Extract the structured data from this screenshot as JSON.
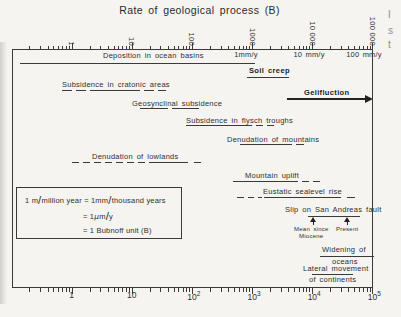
{
  "figure": {
    "title": "Rate of geological process (B)",
    "background": "#f5f4f1",
    "ink": "#3a3a3a",
    "top_axis": {
      "tick_labels": [
        {
          "text": "1",
          "value": 1
        },
        {
          "text": "10",
          "value": 10
        },
        {
          "text": "100",
          "value": 100
        },
        {
          "text": "1000",
          "value": 1000
        },
        {
          "text": "10 000",
          "value": 10000
        },
        {
          "text": "100 000",
          "value": 100000
        }
      ],
      "rate_labels": [
        {
          "text": "1mm/y",
          "x": 246,
          "value_B": 1000
        },
        {
          "text": "10 mm/y",
          "x": 309,
          "value_B": 10000
        },
        {
          "text": "100 mm/y",
          "x": 364,
          "value_B": 100000
        }
      ]
    },
    "bottom_axis": {
      "tick_labels": [
        {
          "base": "1",
          "sup": "",
          "value": 1
        },
        {
          "base": "10",
          "sup": "",
          "value": 10
        },
        {
          "base": "10",
          "sup": "2",
          "value": 100
        },
        {
          "base": "10",
          "sup": "3",
          "value": 1000
        },
        {
          "base": "10",
          "sup": "4",
          "value": 10000
        },
        {
          "base": "10",
          "sup": "5",
          "value": 100000
        }
      ]
    },
    "legend_box": {
      "lines": [
        "1 m/million year = 1mm/thousand years",
        "= 1μm/y",
        "= 1 Bubnoff unit (B)"
      ]
    },
    "edge_fragments": [
      {
        "text": "I",
        "x": 388,
        "y": 9
      },
      {
        "text": "s",
        "x": 388,
        "y": 25
      },
      {
        "text": "t",
        "x": 388,
        "y": 39
      }
    ]
  },
  "chart_data": {
    "type": "range-bar-log",
    "title": "Rate of geological process (B)",
    "x_axis": {
      "scale": "log10",
      "min": 0.1,
      "max": 100000,
      "unit": "Bubnoff units (B) = m/million years",
      "bottom_ticks": [
        "1",
        "10",
        "10^2",
        "10^3",
        "10^4",
        "10^5"
      ],
      "top_ticks": [
        "1",
        "10",
        "100",
        "1000",
        "10 000",
        "100 000"
      ],
      "rate_equivalents": [
        {
          "label": "1mm/y",
          "value_B": 1000
        },
        {
          "label": "10 mm/y",
          "value_B": 10000
        },
        {
          "label": "100 mm/y",
          "value_B": 100000
        }
      ]
    },
    "processes": [
      {
        "name": "Deposition in ocean basins",
        "range_B": [
          0.15,
          1100
        ],
        "labels": [
          {
            "t": "Deposition in ocean basins",
            "x": 103,
            "y": 51
          }
        ],
        "lines": [
          [
            20,
            255,
            63
          ]
        ]
      },
      {
        "name": "Soil creep",
        "bold": true,
        "range_B": [
          800,
          4000
        ],
        "labels": [
          {
            "t": "Soil creep",
            "x": 249,
            "y": 66,
            "b": 1
          }
        ],
        "lines": [
          [
            247,
            289,
            76.5,
            1.6
          ]
        ]
      },
      {
        "name": "Subsidence in cratonic areas",
        "range_B": [
          0.7,
          40
        ],
        "labels": [
          {
            "t": "Subsidence in cratonic areas",
            "x": 62,
            "y": 80
          }
        ],
        "lines": [
          [
            62,
            72,
            90
          ],
          [
            76,
            86,
            90
          ],
          [
            90,
            140,
            90
          ],
          [
            144,
            154,
            90
          ],
          [
            158,
            166,
            90
          ]
        ]
      },
      {
        "name": "Gelifluction",
        "bold": true,
        "range_B": [
          4000,
          100000
        ],
        "open_ended": true,
        "labels": [
          {
            "t": "Gelifluction",
            "x": 304,
            "y": 88,
            "b": 1
          }
        ],
        "arrow": {
          "x1": 287,
          "x2": 365,
          "y": 98,
          "w": 2.2
        }
      },
      {
        "name": "Geosynclinal subsidence",
        "range_B": [
          13,
          140
        ],
        "labels": [
          {
            "t": "Geosynclinal subsidence",
            "x": 132,
            "y": 99
          }
        ],
        "lines": [
          [
            140,
            168,
            108
          ],
          [
            172,
            199,
            108
          ]
        ]
      },
      {
        "name": "Subsidence in flysch troughs",
        "range_B": [
          80,
          2300
        ],
        "labels": [
          {
            "t": "Subsidence in flysch troughs",
            "x": 186,
            "y": 116
          }
        ],
        "lines": [
          [
            186,
            252,
            125
          ],
          [
            256,
            263,
            125
          ],
          [
            267,
            274,
            125
          ]
        ]
      },
      {
        "name": "Denudation of mountains",
        "range_B": [
          630,
          7500
        ],
        "labels": [
          {
            "t": "Denudation of mountains",
            "x": 227,
            "y": 135
          }
        ],
        "lines": [
          [
            240,
            292,
            144
          ],
          [
            296,
            304,
            144
          ]
        ]
      },
      {
        "name": "Denudation of lowlands",
        "range_B": [
          1,
          140
        ],
        "labels": [
          {
            "t": "Denudation of lowlands",
            "x": 92,
            "y": 152
          }
        ],
        "lines": [
          [
            72,
            79,
            162
          ],
          [
            83,
            90,
            162
          ],
          [
            94,
            101,
            162
          ],
          [
            105,
            112,
            162
          ],
          [
            116,
            123,
            162
          ],
          [
            127,
            134,
            162
          ],
          [
            138,
            145,
            162
          ],
          [
            149,
            188,
            162
          ],
          [
            194,
            201,
            162
          ]
        ]
      },
      {
        "name": "Mountain uplift",
        "range_B": [
          500,
          13000
        ],
        "labels": [
          {
            "t": "Mountain uplift",
            "x": 245,
            "y": 171
          }
        ],
        "lines": [
          [
            233,
            298,
            181
          ],
          [
            302,
            309,
            181
          ],
          [
            313,
            320,
            181
          ]
        ]
      },
      {
        "name": "Eustatic sealevel rise",
        "range_B": [
          560,
          50000
        ],
        "labels": [
          {
            "t": "Eustatic sealevel rise",
            "x": 263,
            "y": 187
          }
        ],
        "lines": [
          [
            237,
            244,
            197
          ],
          [
            248,
            254,
            197
          ],
          [
            258,
            262,
            197
          ],
          [
            264,
            341,
            197
          ],
          [
            347,
            355,
            197
          ]
        ]
      },
      {
        "name": "Slip on San Andreas fault",
        "range_B": [
          10000,
          38000
        ],
        "points": [
          {
            "label": "Mean since Miocene",
            "value_B": 10000
          },
          {
            "label": "Present",
            "value_B": 38000
          }
        ],
        "labels": [
          {
            "t": "Slip on San Andreas fault",
            "x": 285,
            "y": 205
          },
          {
            "t": "Mean since",
            "x": 294,
            "y": 226,
            "s": 6
          },
          {
            "t": "Miocene",
            "x": 299,
            "y": 233,
            "s": 6
          },
          {
            "t": "Present",
            "x": 336,
            "y": 226,
            "s": 6
          }
        ],
        "lines": [
          [
            308,
            360,
            215.5
          ]
        ],
        "markers": [
          {
            "x": 313,
            "y": 217
          },
          {
            "x": 347,
            "y": 217
          }
        ]
      },
      {
        "name": "Widening of oceans",
        "range_B": [
          13000,
          100000
        ],
        "labels": [
          {
            "t": "Widening of",
            "x": 322,
            "y": 245
          },
          {
            "t": "oceans",
            "x": 332,
            "y": 257
          }
        ],
        "lines": [
          [
            320,
            374,
            255.5
          ]
        ]
      },
      {
        "name": "Lateral movement of continents",
        "range_B": [
          10000,
          46000
        ],
        "labels": [
          {
            "t": "Lateral movement",
            "x": 303,
            "y": 264
          },
          {
            "t": "of continents",
            "x": 309,
            "y": 275
          }
        ],
        "lines": [
          [
            312,
            353,
            273.5
          ]
        ]
      }
    ]
  }
}
